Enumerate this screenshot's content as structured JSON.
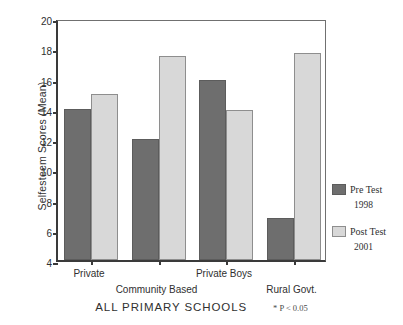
{
  "chart_data": {
    "type": "bar",
    "title": "ALL PRIMARY SCHOOLS",
    "xlabel": "",
    "ylabel": "Selfesteem Scores (Mean)",
    "ylim": [
      4,
      20
    ],
    "ytick_values": [
      4,
      6,
      8,
      10,
      12,
      14,
      16,
      18,
      20
    ],
    "ytick_labels": [
      "4",
      "6",
      "8",
      "10",
      "12",
      "14",
      "16",
      "18",
      "20"
    ],
    "grid": false,
    "legend_position": "right",
    "categories": [
      "Private",
      "Community Based",
      "Private Boys",
      "Rural Govt."
    ],
    "series": [
      {
        "name": "Pre Test",
        "year": "1998",
        "color": "#6e6e6e",
        "values": [
          14.0,
          12.0,
          15.9,
          6.8
        ]
      },
      {
        "name": "Post Test",
        "year": "2001",
        "color": "#d8d8d8",
        "values": [
          15.0,
          17.5,
          13.9,
          17.7
        ]
      }
    ],
    "annotations": [
      "* P < 0.05"
    ]
  },
  "legend": {
    "entries": [
      {
        "label": "Pre Test",
        "year": "1998"
      },
      {
        "label": "Post Test",
        "year": "2001"
      }
    ]
  },
  "footer": {
    "title": "ALL PRIMARY SCHOOLS",
    "note": "* P < 0.05"
  }
}
